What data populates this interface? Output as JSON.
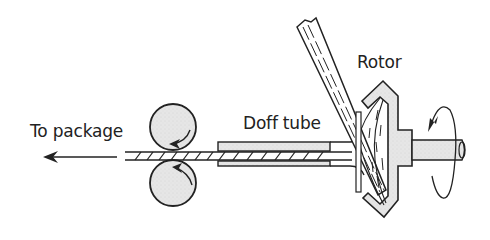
{
  "diagram": {
    "type": "rotor spinning schematic",
    "labels": {
      "to_package": "To package",
      "doff_tube": "Doff tube",
      "rotor": "Rotor"
    },
    "components": [
      "take-up rollers",
      "yarn",
      "doff tube",
      "fibre feed tube",
      "rotor",
      "rotor shaft",
      "rotation arrow",
      "direction arrow"
    ],
    "colors": {
      "stroke": "#222222",
      "fill_grey": "#e4e4e4",
      "background": "#ffffff"
    }
  }
}
